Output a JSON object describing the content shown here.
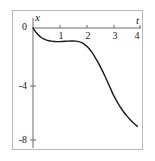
{
  "figure": {
    "background_color": "#ffffff",
    "frame_color": "#b9b9b9",
    "curve_color": "#1a1a1a",
    "axis_color": "#6b6b6b"
  },
  "chart_data": {
    "type": "line",
    "title": "",
    "xlabel": "t",
    "ylabel": "x",
    "xlim": [
      0,
      4
    ],
    "ylim": [
      -8,
      0
    ],
    "grid": false,
    "legend": null,
    "axis_origin_label": "0",
    "xticks": [
      1,
      2,
      3,
      4
    ],
    "xtick_labels": [
      "1",
      "2",
      "3",
      "4"
    ],
    "yticks": [
      -4,
      -8
    ],
    "ytick_labels": [
      "-4",
      "-8"
    ],
    "series": [
      {
        "name": "x(t)",
        "x": [
          0.0,
          0.1,
          0.2,
          0.3,
          0.4,
          0.5,
          0.6,
          0.7,
          0.8,
          0.9,
          1.0,
          1.1,
          1.2,
          1.3,
          1.4,
          1.5,
          1.6,
          1.7,
          1.8,
          1.9,
          2.0,
          2.1,
          2.2,
          2.3,
          2.4,
          2.5,
          2.6,
          2.7,
          2.8,
          2.9,
          3.0,
          3.1,
          3.2,
          3.3,
          3.4,
          3.5,
          3.6,
          3.7,
          3.8,
          3.9
        ],
        "values": [
          0.0,
          -0.28,
          -0.5,
          -0.66,
          -0.78,
          -0.86,
          -0.91,
          -0.94,
          -0.96,
          -0.97,
          -0.97,
          -0.96,
          -0.95,
          -0.94,
          -0.93,
          -0.93,
          -0.94,
          -0.97,
          -1.03,
          -1.13,
          -1.28,
          -1.48,
          -1.73,
          -2.02,
          -2.35,
          -2.7,
          -3.08,
          -3.48,
          -3.9,
          -4.33,
          -4.76,
          -5.12,
          -5.45,
          -5.75,
          -6.02,
          -6.26,
          -6.48,
          -6.68,
          -6.86,
          -7.02
        ]
      }
    ]
  }
}
